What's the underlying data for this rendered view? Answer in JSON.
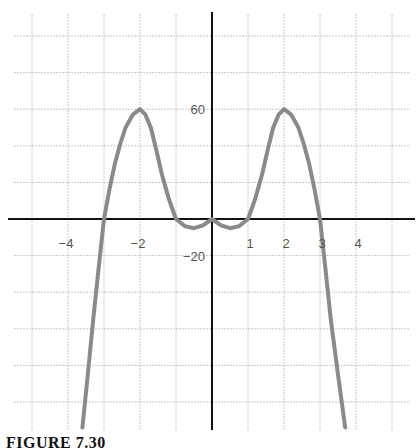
{
  "chart_data": {
    "type": "line",
    "title": "",
    "caption": "FIGURE 7.30",
    "xlabel": "",
    "ylabel": "",
    "xlim": [
      -5.5,
      5.6
    ],
    "ylim": [
      -114,
      114
    ],
    "grid": true,
    "x_grid_step": 1,
    "y_grid_step": 20,
    "x_tick_labels": [
      {
        "value": -4,
        "label": "−4"
      },
      {
        "value": -2,
        "label": "−2"
      },
      {
        "value": 1,
        "label": "1"
      },
      {
        "value": 2,
        "label": "2"
      },
      {
        "value": 3,
        "label": "3"
      },
      {
        "value": 4,
        "label": "4"
      }
    ],
    "y_tick_labels": [
      {
        "value": 60,
        "label": "60"
      },
      {
        "value": -20,
        "label": "−20"
      }
    ],
    "series": [
      {
        "name": "curve",
        "color": "#8a8a8a",
        "points": [
          [
            -3.6,
            -114
          ],
          [
            -3.45,
            -85
          ],
          [
            -3.3,
            -55
          ],
          [
            -3.15,
            -27
          ],
          [
            -3.0,
            0
          ],
          [
            -2.85,
            16
          ],
          [
            -2.7,
            30
          ],
          [
            -2.55,
            41
          ],
          [
            -2.4,
            50
          ],
          [
            -2.2,
            57
          ],
          [
            -2.0,
            60
          ],
          [
            -1.85,
            57
          ],
          [
            -1.7,
            50
          ],
          [
            -1.55,
            38
          ],
          [
            -1.4,
            25
          ],
          [
            -1.2,
            11
          ],
          [
            -1.0,
            0
          ],
          [
            -0.75,
            -4
          ],
          [
            -0.5,
            -5
          ],
          [
            -0.25,
            -3.5
          ],
          [
            0,
            0
          ],
          [
            0.25,
            -3.5
          ],
          [
            0.5,
            -5
          ],
          [
            0.75,
            -4
          ],
          [
            1.0,
            0
          ],
          [
            1.2,
            11
          ],
          [
            1.4,
            25
          ],
          [
            1.55,
            38
          ],
          [
            1.7,
            50
          ],
          [
            1.85,
            57
          ],
          [
            2.0,
            60
          ],
          [
            2.2,
            57
          ],
          [
            2.4,
            50
          ],
          [
            2.55,
            41
          ],
          [
            2.7,
            30
          ],
          [
            2.85,
            16
          ],
          [
            3.0,
            0
          ],
          [
            3.15,
            -27
          ],
          [
            3.3,
            -55
          ],
          [
            3.5,
            -85
          ],
          [
            3.7,
            -114
          ]
        ]
      }
    ],
    "colors": {
      "axis": "#111111",
      "grid": "#c8c8c8",
      "curve": "#8a8a8a",
      "label": "#555555"
    }
  }
}
